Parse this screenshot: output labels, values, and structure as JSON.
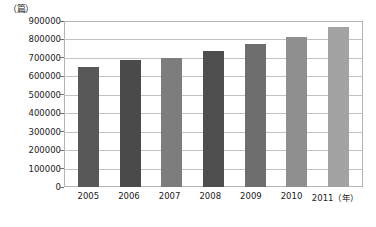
{
  "chart_data": {
    "type": "bar",
    "title": "",
    "xlabel": "（年）",
    "ylabel": "（篇）",
    "categories": [
      "2005",
      "2006",
      "2007",
      "2008",
      "2009",
      "2010",
      "2011"
    ],
    "values": [
      650000,
      690000,
      702000,
      740000,
      778000,
      815000,
      865000
    ],
    "ylim": [
      0,
      900000
    ],
    "ytick_labels": [
      "900000",
      "800000",
      "700000",
      "600000",
      "500000",
      "400000",
      "300000",
      "200000",
      "100000",
      "0"
    ],
    "ytick_values": [
      900000,
      800000,
      700000,
      600000,
      500000,
      400000,
      300000,
      200000,
      100000,
      0
    ],
    "ytick_step": 100000,
    "grid": true,
    "legend": "none",
    "bar_colors": [
      "#585858",
      "#4a4a4a",
      "#7d7d7d",
      "#4f4f4f",
      "#6e6e6e",
      "#8f8f8f",
      "#a3a3a3"
    ],
    "plot_border_color": "#b4b4b4",
    "gridline_color": "#c2c2c2",
    "background_color": "#ffffff"
  }
}
